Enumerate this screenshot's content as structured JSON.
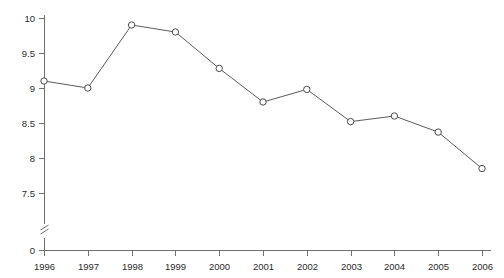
{
  "chart_data": {
    "type": "line",
    "title": "",
    "xlabel": "",
    "ylabel": "",
    "categories": [
      "1996",
      "1997",
      "1998",
      "1999",
      "2000",
      "2001",
      "2002",
      "2003",
      "2004",
      "2005",
      "2006"
    ],
    "values": [
      9.1,
      9.0,
      9.9,
      9.8,
      9.28,
      8.8,
      8.98,
      8.52,
      8.6,
      8.37,
      7.85
    ],
    "series": [
      {
        "name": "series-1",
        "values": [
          9.1,
          9.0,
          9.9,
          9.8,
          9.28,
          8.8,
          8.98,
          8.52,
          8.6,
          8.37,
          7.85
        ]
      }
    ],
    "ylim": [
      7.5,
      10.0
    ],
    "y_ticks": [
      "10",
      "9.5",
      "9",
      "8.5",
      "8",
      "7.5"
    ],
    "y_tick_values": [
      10,
      9.5,
      9,
      8.5,
      8,
      7.5
    ],
    "y_baseline_label": "0",
    "axis_break": true,
    "grid": false,
    "legend": "none",
    "marker_style": "open-circle",
    "line_color": "#5b5b5b",
    "marker_fill": "#ffffff",
    "marker_stroke": "#4a4a4a",
    "background": "#ffffff"
  }
}
